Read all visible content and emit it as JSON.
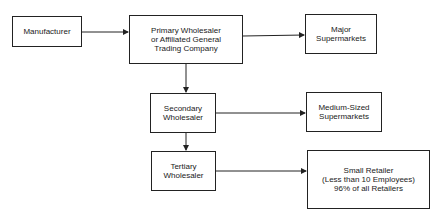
{
  "diagram": {
    "nodes": [
      {
        "id": "manufacturer",
        "label": "Manufacturer"
      },
      {
        "id": "primary",
        "label": "Primary Wholesaler\nor Affiliated General\nTrading Company"
      },
      {
        "id": "major",
        "label": "Major\nSupermarkets"
      },
      {
        "id": "secondary",
        "label": "Secondary\nWholesaler"
      },
      {
        "id": "medium",
        "label": "Medium-Sized\nSupermarkets"
      },
      {
        "id": "tertiary",
        "label": "Tertiary\nWholesaler"
      },
      {
        "id": "small",
        "label": "Small Retailer\n(Less than 10 Employees)\n96% of all Retailers"
      }
    ],
    "edges": [
      {
        "from": "manufacturer",
        "to": "primary"
      },
      {
        "from": "primary",
        "to": "major"
      },
      {
        "from": "primary",
        "to": "secondary"
      },
      {
        "from": "secondary",
        "to": "medium"
      },
      {
        "from": "secondary",
        "to": "tertiary"
      },
      {
        "from": "tertiary",
        "to": "small"
      }
    ]
  }
}
